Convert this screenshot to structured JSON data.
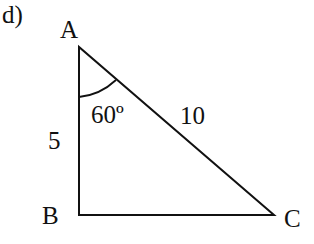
{
  "problem_label": "d)",
  "vertices": {
    "A": "A",
    "B": "B",
    "C": "C"
  },
  "sides": {
    "AB": "5",
    "AC": "10"
  },
  "angle": {
    "at": "A",
    "label": "60º"
  },
  "colors": {
    "stroke": "#111111",
    "background": "#ffffff"
  }
}
